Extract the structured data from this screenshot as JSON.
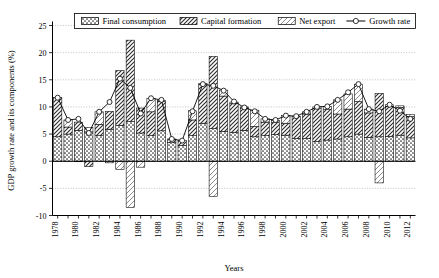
{
  "chart_data": {
    "type": "bar",
    "title": "",
    "xlabel": "Years",
    "ylabel": "GDP growth rate and its components (%)",
    "ylim": [
      -10,
      25
    ],
    "yticks": [
      -10,
      -5,
      0,
      5,
      10,
      15,
      20,
      25
    ],
    "xlim": [
      1978,
      2012
    ],
    "xticks": [
      1978,
      1980,
      1982,
      1984,
      1986,
      1988,
      1990,
      1992,
      1994,
      1996,
      1998,
      2000,
      2002,
      2004,
      2006,
      2008,
      2010,
      2012
    ],
    "grid": true,
    "legend_position": "top",
    "stacked": true,
    "categories": [
      1978,
      1979,
      1980,
      1981,
      1982,
      1983,
      1984,
      1985,
      1986,
      1987,
      1988,
      1989,
      1990,
      1991,
      1992,
      1993,
      1994,
      1995,
      1996,
      1997,
      1998,
      1999,
      2000,
      2001,
      2002,
      2003,
      2004,
      2005,
      2006,
      2007,
      2008,
      2009,
      2010,
      2011,
      2012
    ],
    "series": [
      {
        "name": "Final consumption",
        "type": "bar",
        "values": [
          4.5,
          5.0,
          5.7,
          5.4,
          4.7,
          5.9,
          6.6,
          7.3,
          5.2,
          4.7,
          5.6,
          3.4,
          2.9,
          4.7,
          7.0,
          6.0,
          5.5,
          5.3,
          5.7,
          4.5,
          4.7,
          4.9,
          4.8,
          4.2,
          4.2,
          3.6,
          3.9,
          4.1,
          4.5,
          5.0,
          4.4,
          4.5,
          4.6,
          4.8,
          4.3
        ]
      },
      {
        "name": "Capital formation",
        "type": "bar",
        "values": [
          7.2,
          1.3,
          1.5,
          -1.0,
          2.1,
          3.3,
          10.1,
          15.0,
          4.6,
          4.4,
          5.4,
          0.7,
          0.9,
          2.9,
          7.3,
          13.3,
          6.5,
          5.3,
          4.1,
          1.9,
          2.5,
          2.2,
          2.2,
          4.1,
          4.5,
          6.1,
          5.6,
          4.6,
          5.1,
          6.0,
          4.5,
          8.0,
          5.5,
          5.1,
          3.9
        ]
      },
      {
        "name": "Net export",
        "type": "bar",
        "values": [
          0.0,
          1.3,
          -0.1,
          0.8,
          2.3,
          -0.3,
          -1.5,
          -8.5,
          -1.1,
          2.5,
          0.2,
          0.0,
          0.0,
          1.7,
          0.0,
          -6.5,
          1.1,
          0.3,
          0.2,
          3.0,
          0.6,
          0.4,
          1.4,
          0.0,
          0.4,
          0.3,
          0.6,
          2.6,
          2.8,
          3.2,
          0.7,
          -4.0,
          0.3,
          0.3,
          0.4
        ]
      }
    ],
    "line_series": {
      "name": "Growth rate",
      "values": [
        11.7,
        7.6,
        7.8,
        5.2,
        9.1,
        10.9,
        15.2,
        13.5,
        8.8,
        11.6,
        11.3,
        4.1,
        3.8,
        9.2,
        14.2,
        13.9,
        13.0,
        11.0,
        9.9,
        9.2,
        7.8,
        7.6,
        8.4,
        8.3,
        9.1,
        10.0,
        10.1,
        11.3,
        12.7,
        14.2,
        9.6,
        9.2,
        10.4,
        9.3,
        7.8
      ]
    }
  },
  "legend": {
    "items": [
      {
        "label": "Final consumption",
        "pattern": "dots"
      },
      {
        "label": "Capital formation",
        "pattern": "diagonal"
      },
      {
        "label": "Net export",
        "pattern": "light-diagonal"
      },
      {
        "label": "Growth rate",
        "pattern": "line-marker"
      }
    ]
  }
}
